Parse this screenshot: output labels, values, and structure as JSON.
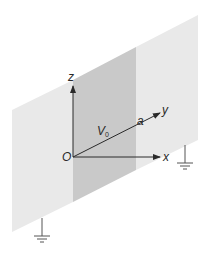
{
  "figure": {
    "colors": {
      "background": "#ffffff",
      "grounded_plane": "#e9e9e9",
      "strip": "#c9c9c9",
      "axis": "#2a2a2a",
      "ground_symbol": "#555555"
    }
  },
  "labels": {
    "z_axis": "z",
    "y_axis": "y",
    "x_axis": "x",
    "origin": "O",
    "potential_main": "V",
    "potential_sub": "0",
    "width": "a"
  },
  "regions": [
    {
      "name": "left-grounded-plane",
      "potential": "grounded"
    },
    {
      "name": "conducting-strip",
      "potential": "V0",
      "width": "a"
    },
    {
      "name": "right-grounded-plane",
      "potential": "grounded"
    }
  ],
  "ground_symbols": [
    {
      "name": "ground-left"
    },
    {
      "name": "ground-right"
    }
  ]
}
